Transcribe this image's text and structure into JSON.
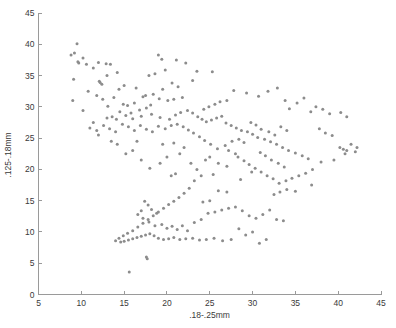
{
  "chart_data": {
    "type": "scatter",
    "title": "",
    "xlabel": ".18-.25mm",
    "ylabel": ".125-.18mm",
    "xlim": [
      5,
      45
    ],
    "ylim": [
      0,
      45
    ],
    "xticks": [
      5,
      10,
      15,
      20,
      25,
      30,
      35,
      40,
      45
    ],
    "yticks": [
      0,
      5,
      10,
      15,
      20,
      25,
      30,
      35,
      40,
      45
    ],
    "grid": false,
    "legend": null,
    "marker": {
      "shape": "dot",
      "color": "#8c8c8c",
      "size": 1.5
    },
    "series": [
      {
        "name": "samples",
        "points": [
          [
            9.5,
            40.1
          ],
          [
            9.2,
            38.6
          ],
          [
            8.8,
            38.3
          ],
          [
            10.2,
            37.8
          ],
          [
            9.6,
            37.2
          ],
          [
            9.7,
            37.0
          ],
          [
            10.6,
            36.8
          ],
          [
            12.0,
            37.1
          ],
          [
            12.9,
            36.9
          ],
          [
            11.4,
            36.2
          ],
          [
            13.4,
            36.8
          ],
          [
            9.1,
            34.4
          ],
          [
            12.1,
            34.1
          ],
          [
            12.2,
            33.9
          ],
          [
            12.4,
            33.6
          ],
          [
            19.0,
            38.3
          ],
          [
            19.4,
            37.6
          ],
          [
            21.1,
            37.5
          ],
          [
            22.2,
            37.0
          ],
          [
            19.8,
            35.9
          ],
          [
            18.6,
            35.3
          ],
          [
            17.9,
            35.0
          ],
          [
            23.5,
            35.7
          ],
          [
            25.3,
            35.6
          ],
          [
            23.0,
            34.2
          ],
          [
            20.6,
            33.8
          ],
          [
            21.3,
            33.2
          ],
          [
            19.5,
            32.8
          ],
          [
            18.4,
            32.0
          ],
          [
            17.5,
            31.8
          ],
          [
            17.2,
            31.6
          ],
          [
            19.1,
            31.3
          ],
          [
            20.1,
            31.0
          ],
          [
            20.8,
            31.2
          ],
          [
            21.8,
            31.5
          ],
          [
            16.2,
            30.6
          ],
          [
            15.4,
            30.2
          ],
          [
            14.9,
            30.4
          ],
          [
            13.1,
            30.1
          ],
          [
            10.2,
            29.4
          ],
          [
            14.5,
            29.2
          ],
          [
            15.8,
            29.0
          ],
          [
            16.8,
            29.5
          ],
          [
            17.6,
            29.8
          ],
          [
            18.1,
            30.3
          ],
          [
            11.4,
            27.5
          ],
          [
            13.0,
            28.2
          ],
          [
            13.6,
            28.4
          ],
          [
            14.1,
            28.0
          ],
          [
            15.2,
            28.6
          ],
          [
            16.0,
            28.1
          ],
          [
            17.0,
            28.5
          ],
          [
            18.2,
            28.8
          ],
          [
            19.2,
            28.3
          ],
          [
            20.3,
            28.0
          ],
          [
            21.0,
            28.7
          ],
          [
            21.6,
            29.1
          ],
          [
            22.4,
            29.4
          ],
          [
            23.0,
            29.0
          ],
          [
            23.6,
            28.4
          ],
          [
            24.1,
            28.0
          ],
          [
            24.6,
            27.6
          ],
          [
            25.2,
            27.9
          ],
          [
            25.8,
            28.2
          ],
          [
            26.4,
            28.5
          ],
          [
            24.3,
            29.6
          ],
          [
            24.9,
            30.0
          ],
          [
            25.6,
            30.4
          ],
          [
            26.2,
            30.8
          ],
          [
            27.0,
            31.0
          ],
          [
            27.8,
            32.6
          ],
          [
            29.3,
            32.2
          ],
          [
            30.7,
            31.7
          ],
          [
            31.8,
            32.5
          ],
          [
            32.9,
            33.0
          ],
          [
            33.8,
            31.0
          ],
          [
            35.2,
            30.6
          ],
          [
            36.0,
            31.4
          ],
          [
            34.3,
            29.7
          ],
          [
            36.8,
            29.2
          ],
          [
            37.4,
            30.0
          ],
          [
            38.2,
            29.6
          ],
          [
            39.0,
            28.9
          ],
          [
            40.3,
            29.1
          ],
          [
            41.0,
            28.4
          ],
          [
            26.9,
            27.4
          ],
          [
            27.5,
            27.0
          ],
          [
            28.1,
            26.6
          ],
          [
            28.7,
            26.2
          ],
          [
            29.4,
            26.0
          ],
          [
            30.0,
            25.6
          ],
          [
            30.6,
            25.1
          ],
          [
            31.4,
            24.8
          ],
          [
            32.1,
            24.4
          ],
          [
            32.8,
            24.0
          ],
          [
            33.5,
            23.5
          ],
          [
            34.2,
            23.0
          ],
          [
            35.0,
            22.6
          ],
          [
            35.8,
            22.2
          ],
          [
            36.5,
            21.7
          ],
          [
            31.0,
            26.4
          ],
          [
            31.9,
            26.0
          ],
          [
            32.6,
            25.5
          ],
          [
            33.3,
            26.8
          ],
          [
            34.0,
            26.2
          ],
          [
            29.8,
            27.5
          ],
          [
            30.4,
            27.1
          ],
          [
            28.4,
            24.8
          ],
          [
            29.0,
            24.3
          ],
          [
            27.6,
            24.5
          ],
          [
            26.8,
            23.8
          ],
          [
            27.2,
            23.0
          ],
          [
            28.0,
            22.5
          ],
          [
            25.9,
            23.3
          ],
          [
            25.1,
            24.0
          ],
          [
            24.4,
            24.6
          ],
          [
            23.8,
            25.2
          ],
          [
            23.1,
            25.8
          ],
          [
            22.5,
            26.3
          ],
          [
            21.9,
            26.8
          ],
          [
            21.2,
            27.2
          ],
          [
            20.5,
            27.0
          ],
          [
            19.8,
            26.5
          ],
          [
            19.0,
            26.9
          ],
          [
            18.3,
            26.0
          ],
          [
            17.6,
            26.4
          ],
          [
            16.9,
            27.0
          ],
          [
            16.2,
            26.2
          ],
          [
            15.5,
            26.8
          ],
          [
            14.8,
            27.2
          ],
          [
            14.0,
            26.0
          ],
          [
            13.3,
            26.5
          ],
          [
            12.6,
            27.0
          ],
          [
            11.8,
            26.2
          ],
          [
            11.0,
            26.6
          ],
          [
            40.2,
            23.5
          ],
          [
            40.6,
            23.2
          ],
          [
            41.0,
            23.0
          ],
          [
            40.8,
            22.5
          ],
          [
            42.0,
            22.8
          ],
          [
            39.5,
            21.5
          ],
          [
            38.0,
            21.2
          ],
          [
            37.0,
            20.0
          ],
          [
            36.2,
            19.4
          ],
          [
            35.4,
            19.0
          ],
          [
            34.6,
            18.6
          ],
          [
            33.9,
            18.2
          ],
          [
            33.1,
            17.8
          ],
          [
            32.4,
            18.5
          ],
          [
            31.7,
            19.0
          ],
          [
            31.0,
            19.6
          ],
          [
            30.3,
            20.2
          ],
          [
            29.6,
            20.8
          ],
          [
            29.0,
            21.4
          ],
          [
            28.3,
            22.0
          ],
          [
            30.9,
            22.7
          ],
          [
            31.5,
            22.2
          ],
          [
            32.2,
            21.5
          ],
          [
            33.0,
            21.0
          ],
          [
            33.7,
            20.4
          ],
          [
            36.9,
            17.5
          ],
          [
            35.0,
            16.5
          ],
          [
            34.0,
            16.8
          ],
          [
            33.2,
            16.4
          ],
          [
            32.5,
            16.0
          ],
          [
            25.4,
            19.2
          ],
          [
            24.0,
            19.0
          ],
          [
            23.2,
            18.2
          ],
          [
            22.6,
            17.0
          ],
          [
            22.0,
            16.2
          ],
          [
            21.4,
            15.5
          ],
          [
            20.8,
            14.9
          ],
          [
            20.2,
            14.4
          ],
          [
            19.6,
            13.8
          ],
          [
            19.0,
            13.2
          ],
          [
            18.4,
            12.6
          ],
          [
            17.8,
            12.0
          ],
          [
            17.2,
            11.4
          ],
          [
            16.6,
            10.8
          ],
          [
            16.0,
            10.2
          ],
          [
            15.4,
            9.8
          ],
          [
            14.9,
            9.4
          ],
          [
            14.4,
            9.0
          ],
          [
            14.0,
            8.6
          ],
          [
            14.6,
            8.4
          ],
          [
            15.0,
            8.5
          ],
          [
            15.5,
            8.7
          ],
          [
            16.0,
            8.9
          ],
          [
            16.5,
            9.1
          ],
          [
            17.0,
            9.3
          ],
          [
            17.5,
            9.5
          ],
          [
            18.0,
            9.7
          ],
          [
            18.5,
            9.4
          ],
          [
            19.0,
            9.0
          ],
          [
            19.6,
            8.8
          ],
          [
            20.2,
            8.9
          ],
          [
            20.8,
            9.1
          ],
          [
            21.5,
            8.8
          ],
          [
            22.2,
            8.9
          ],
          [
            23.0,
            9.0
          ],
          [
            23.8,
            8.7
          ],
          [
            24.6,
            8.8
          ],
          [
            25.5,
            9.0
          ],
          [
            26.5,
            8.6
          ],
          [
            27.5,
            8.8
          ],
          [
            17.4,
            14.9
          ],
          [
            17.8,
            14.3
          ],
          [
            18.2,
            13.6
          ],
          [
            18.8,
            13.0
          ],
          [
            17.0,
            13.4
          ],
          [
            16.6,
            12.8
          ],
          [
            17.2,
            12.2
          ],
          [
            17.9,
            11.6
          ],
          [
            18.6,
            11.0
          ],
          [
            19.4,
            11.2
          ],
          [
            20.0,
            10.6
          ],
          [
            20.6,
            10.9
          ],
          [
            21.2,
            10.4
          ],
          [
            21.8,
            11.0
          ],
          [
            22.4,
            10.2
          ],
          [
            23.2,
            11.5
          ],
          [
            24.0,
            12.0
          ],
          [
            24.8,
            13.0
          ],
          [
            25.6,
            13.2
          ],
          [
            26.4,
            13.5
          ],
          [
            27.2,
            13.8
          ],
          [
            28.0,
            14.0
          ],
          [
            28.8,
            13.4
          ],
          [
            29.6,
            12.6
          ],
          [
            30.4,
            12.2
          ],
          [
            31.2,
            12.8
          ],
          [
            32.0,
            13.5
          ],
          [
            32.8,
            12.0
          ],
          [
            33.6,
            11.8
          ],
          [
            30.0,
            10.0
          ],
          [
            29.2,
            9.5
          ],
          [
            28.4,
            10.5
          ],
          [
            30.8,
            8.2
          ],
          [
            31.6,
            8.8
          ],
          [
            26.0,
            16.6
          ],
          [
            27.0,
            16.4
          ],
          [
            28.6,
            18.4
          ],
          [
            29.9,
            19.6
          ],
          [
            25.0,
            15.0
          ],
          [
            24.2,
            14.8
          ],
          [
            17.6,
            6.0
          ],
          [
            17.7,
            5.7
          ],
          [
            15.6,
            3.6
          ],
          [
            20.5,
            19.0
          ],
          [
            21.0,
            19.3
          ],
          [
            16.0,
            23.0
          ],
          [
            15.2,
            22.5
          ],
          [
            17.0,
            21.5
          ],
          [
            18.0,
            20.2
          ],
          [
            19.2,
            21.0
          ],
          [
            20.0,
            22.0
          ],
          [
            21.5,
            22.5
          ],
          [
            22.8,
            21.0
          ],
          [
            23.5,
            20.0
          ],
          [
            24.5,
            21.5
          ],
          [
            14.2,
            24.0
          ],
          [
            13.5,
            24.5
          ],
          [
            16.5,
            24.5
          ],
          [
            19.5,
            24.0
          ],
          [
            20.8,
            24.2
          ],
          [
            22.0,
            23.5
          ],
          [
            12.0,
            25.5
          ],
          [
            26.0,
            21.0
          ],
          [
            27.0,
            20.5
          ],
          [
            25.0,
            22.0
          ],
          [
            9.0,
            31.0
          ],
          [
            11.8,
            31.8
          ],
          [
            12.5,
            31.2
          ],
          [
            13.8,
            31.5
          ],
          [
            10.8,
            32.5
          ],
          [
            14.4,
            32.8
          ],
          [
            15.0,
            33.4
          ],
          [
            16.4,
            33.0
          ],
          [
            13.0,
            35.0
          ],
          [
            14.2,
            35.5
          ],
          [
            38.5,
            25.8
          ],
          [
            39.3,
            25.4
          ],
          [
            37.8,
            26.5
          ],
          [
            41.5,
            24.0
          ],
          [
            42.2,
            23.5
          ]
        ]
      }
    ]
  },
  "axes": {
    "x_tick_labels": [
      "5",
      "10",
      "15",
      "20",
      "25",
      "30",
      "35",
      "40",
      "45"
    ],
    "y_tick_labels": [
      "0",
      "5",
      "10",
      "15",
      "20",
      "25",
      "30",
      "35",
      "40",
      "45"
    ],
    "x_axis_title": ".18-.25mm",
    "y_axis_title": ".125-.18mm"
  },
  "style": {
    "axis_color": "#9a9a9a",
    "text_color": "#3a3a3a",
    "marker_color": "#8c8c8c",
    "background": "#ffffff"
  }
}
